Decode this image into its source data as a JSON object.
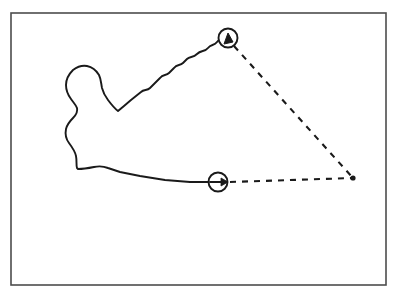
{
  "figure": {
    "background_color": "#ffffff",
    "stroke_color": "#1a1a1a",
    "frame_color": "#4d4d4d",
    "width": 408,
    "height": 298
  },
  "frame": {
    "x": 11,
    "y": 13,
    "width": 375,
    "height": 272,
    "stroke_width": 1.6,
    "fill": "none"
  },
  "contour": {
    "name": "closed-blob-contour",
    "description": "irregular closed outline resembling a bone shape, open toward the right",
    "stroke_width": 1.9,
    "fill": "none",
    "path": "M 228 38 C 224 36 220 38 217 42 C 214 46 211 44 208 48 C 205 52 201 50 197 54 C 193 58 190 56 187 59 L 183 63 C 180 66 177 64 174 68 L 169 73 C 166 76 163 74 160 78 L 150 88 C 147 91 144 89 141 92 L 131 100 L 124 106 L 118 111 C 114 108 111 104 108 100 C 105 96 103 92 102 88 C 101 83 101 79 99 75 C 96 70 92 67 87 66 C 82 65 77 67 73 70 C 69 74 66 79 66 85 C 66 90 68 95 71 99 C 73 102 76 105 77 108 C 78 112 76 115 73 118 C 70 121 67 125 66 129 C 65 134 66 139 69 143 C 72 147 75 151 76 156 C 77 161 76 165 77 168 L 78 169 C 83 169 89 168 94 167 C 99 166 103 166 108 168 L 120 172 L 140 176 L 165 180 L 190 182 L 209 182"
  },
  "markers": [
    {
      "name": "direction-marker-top",
      "cx": 228,
      "cy": 38,
      "r": 9.5,
      "stroke_width": 1.9,
      "fill": "#ffffff",
      "arrow_type": "arrowhead-up",
      "arrow_path": "M 224 44 L 228 33 L 233 42 Z"
    },
    {
      "name": "direction-marker-bottom",
      "cx": 218,
      "cy": 182,
      "r": 9.5,
      "stroke_width": 1.9,
      "fill": "#ffffff",
      "arrow_type": "arrow-right",
      "arrow_shaft": "M 210 182 L 226 182",
      "arrow_head": "M 221 178 L 228 182 L 221 186 Z"
    }
  ],
  "vertex_point": {
    "name": "apex-vertex-point",
    "cx": 353,
    "cy": 178,
    "r": 2.6,
    "fill": "#1a1a1a"
  },
  "dashed_lines": [
    {
      "name": "dashed-line-upper",
      "from": [
        234,
        46
      ],
      "to": [
        353,
        178
      ],
      "dash_pattern": "6 6",
      "stroke_width": 2.1
    },
    {
      "name": "dashed-line-lower",
      "from": [
        230,
        182
      ],
      "to": [
        353,
        178
      ],
      "dash_pattern": "6 6",
      "stroke_width": 2.1
    }
  ],
  "chart_data": {
    "type": "scatter",
    "xlabel": "",
    "ylabel": "",
    "xlim": [
      11,
      386
    ],
    "ylim": [
      13,
      285
    ],
    "grid": false,
    "legend": "none",
    "annotations": [
      "top direction marker (arrow up) at (228, 38)",
      "bottom direction marker (arrow right) at (218, 182)",
      "apex vertex dot at (353, 178)"
    ],
    "series": [
      {
        "name": "markers",
        "x": [
          228,
          218,
          353
        ],
        "values": [
          38,
          182,
          178
        ]
      }
    ]
  }
}
